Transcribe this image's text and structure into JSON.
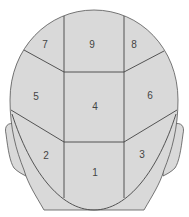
{
  "diagram": {
    "colors": {
      "fill": "#d9d9d9",
      "stroke": "#555555",
      "label": "#444444"
    },
    "zones": [
      {
        "id": "1",
        "label": "1"
      },
      {
        "id": "2",
        "label": "2"
      },
      {
        "id": "3",
        "label": "3"
      },
      {
        "id": "4",
        "label": "4"
      },
      {
        "id": "5",
        "label": "5"
      },
      {
        "id": "6",
        "label": "6"
      },
      {
        "id": "7",
        "label": "7"
      },
      {
        "id": "8",
        "label": "8"
      },
      {
        "id": "9",
        "label": "9"
      }
    ]
  }
}
